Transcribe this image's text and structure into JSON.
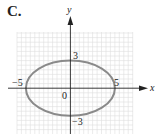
{
  "panel": {
    "label": "C."
  },
  "graph": {
    "x_axis_label": "x",
    "y_axis_label": "y",
    "origin_label": "0",
    "tick_labels": {
      "x_neg": "−5",
      "x_pos": "5",
      "y_pos": "3",
      "y_neg": "−3"
    },
    "curve": {
      "type": "ellipse",
      "center": [
        0,
        0
      ],
      "semi_major_x": 5,
      "semi_minor_y": 3,
      "color": "#8a8a8a"
    },
    "grid": {
      "x_range": [
        -6,
        7
      ],
      "y_range": [
        -5,
        6
      ],
      "color": "#dddddd"
    }
  }
}
